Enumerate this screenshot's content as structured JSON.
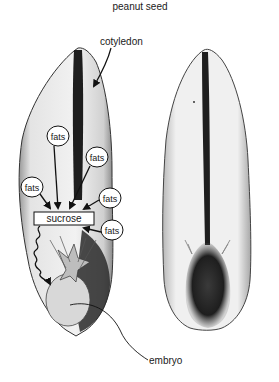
{
  "title": "peanut seed",
  "labels": {
    "cotyledon": "cotyledon",
    "embryo": "embryo",
    "sucrose": "sucrose"
  },
  "fats_bubbles": [
    {
      "label": "fats",
      "x": 58,
      "y": 136
    },
    {
      "label": "fats",
      "x": 97,
      "y": 157
    },
    {
      "label": "fats",
      "x": 32,
      "y": 187
    },
    {
      "label": "fats",
      "x": 110,
      "y": 198
    },
    {
      "label": "fats",
      "x": 112,
      "y": 230
    }
  ],
  "colors": {
    "background": "#ffffff",
    "ink": "#1a1a1a",
    "seed_fill": "#e6e6e6",
    "seed_dark": "#2a2a2a"
  }
}
